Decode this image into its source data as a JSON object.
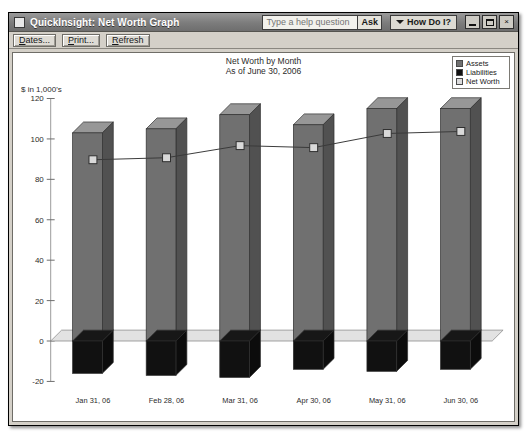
{
  "window": {
    "title": "QuickInsight: Net Worth Graph",
    "title_icon": "app-icon",
    "help_placeholder": "Type a help question",
    "help_value": "",
    "ask_label": "Ask",
    "how_do_i_label": "How Do I?",
    "minimize_label": "Minimize",
    "maximize_label": "Maximize",
    "close_label": "×"
  },
  "toolbar": {
    "buttons": [
      {
        "id": "dates",
        "label": "Dates...",
        "accel": "D",
        "rest": "ates..."
      },
      {
        "id": "print",
        "label": "Print...",
        "accel": "P",
        "rest": "rint..."
      },
      {
        "id": "refresh",
        "label": "Refresh",
        "accel": "R",
        "rest": "efresh"
      }
    ]
  },
  "chart_data": {
    "type": "bar",
    "title": "Net Worth by Month",
    "subtitle": "As of June 30, 2006",
    "xlabel": "",
    "ylabel": "$ in 1,000's",
    "ylim": [
      -20,
      120
    ],
    "yticks": [
      120,
      100,
      80,
      60,
      40,
      20,
      0,
      -20
    ],
    "grid": false,
    "legend_position": "top-right",
    "categories": [
      "Jan 31, 06",
      "Feb 28, 06",
      "Mar 31, 06",
      "Apr 30, 06",
      "May 31, 06",
      "Jun 30, 06"
    ],
    "series": [
      {
        "name": "Assets",
        "type": "bar",
        "color": "#707070",
        "values": [
          103,
          105,
          112,
          107,
          115,
          115
        ]
      },
      {
        "name": "Liabilities",
        "type": "bar",
        "color": "#111111",
        "values": [
          -16,
          -17,
          -18,
          -14,
          -15,
          -14
        ]
      },
      {
        "name": "Net Worth",
        "type": "line",
        "color": "#d9d9d9",
        "values": [
          87,
          88,
          94,
          93,
          100,
          101
        ]
      }
    ]
  },
  "legend": [
    {
      "label": "Assets",
      "swatch": "#707070"
    },
    {
      "label": "Liabilities",
      "swatch": "#111111"
    },
    {
      "label": "Net Worth",
      "swatch": "#dcdcdc"
    }
  ]
}
